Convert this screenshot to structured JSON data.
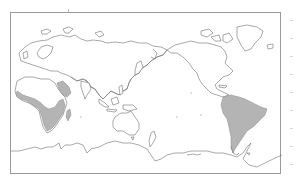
{
  "map": {
    "projection": "pacific-centered-world-outline",
    "frame_color": "#9a9a9a",
    "coastline_color": "#6e6e6e",
    "background_color": "#ffffff",
    "shaded_regions": [
      {
        "name": "africa-southern-and-western",
        "fill": "#b4b4b4"
      },
      {
        "name": "arabian-peninsula",
        "fill": "#b4b4b4"
      },
      {
        "name": "madagascar",
        "fill": "#b4b4b4"
      },
      {
        "name": "south-america",
        "fill": "#b4b4b4"
      }
    ],
    "landmasses": [
      "europe",
      "africa",
      "asia",
      "australia",
      "north-america",
      "greenland",
      "south-america",
      "antarctica",
      "new-zealand",
      "japan",
      "indonesia"
    ],
    "text_labels": []
  }
}
